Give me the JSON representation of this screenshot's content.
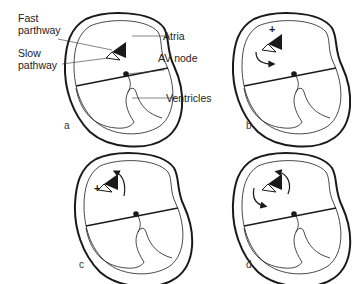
{
  "figure": {
    "panels": [
      {
        "id": "a",
        "letter": "a",
        "state": "baseline: fast and slow pathways shown"
      },
      {
        "id": "b",
        "letter": "b",
        "state": "premature beat (+) blocked in fast pathway, conducts down slow pathway"
      },
      {
        "id": "c",
        "letter": "c",
        "state": "impulse (+) returns retrogradely up fast pathway"
      },
      {
        "id": "d",
        "letter": "d",
        "state": "sustained re-entry circuit around both pathways"
      }
    ],
    "labels": {
      "fast_pathway_line1": "Fast",
      "fast_pathway_line2": "parthway",
      "slow_pathway_line1": "Slow",
      "slow_pathway_line2": "pathway",
      "atria": "Atria",
      "av_node": "AV node",
      "ventricles": "Ventricles"
    },
    "symbols": {
      "plus": "+"
    },
    "colors": {
      "ink": "#1a1a1a",
      "background": "#ffffff"
    }
  }
}
